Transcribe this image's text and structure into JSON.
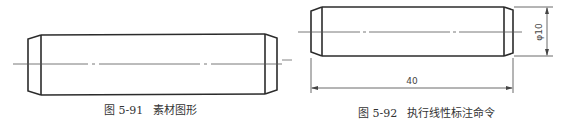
{
  "figures": [
    {
      "id": "left",
      "caption_number": "图 5-91",
      "caption_title": "素材图形",
      "shape": "chamfered cylinder pin (side view)"
    },
    {
      "id": "right",
      "caption_number": "图 5-92",
      "caption_title": "执行线性标注命令",
      "shape": "chamfered cylinder pin (side view) with dimensions",
      "dimensions": {
        "diameter_label": "φ10",
        "length_label": "40"
      }
    }
  ],
  "colors": {
    "line": "#2b2b2b",
    "thin_line": "#555555",
    "background": "#ffffff"
  }
}
